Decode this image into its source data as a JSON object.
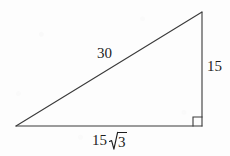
{
  "figure": {
    "kind": "right-triangle",
    "background_color": "#fdfdfd",
    "stroke_color": "#3a3a3a",
    "text_color": "#1d1d1d"
  },
  "geometry": {
    "left_vertex": {
      "x": 16,
      "y": 126
    },
    "bottom_right_vertex": {
      "x": 202,
      "y": 126
    },
    "top_vertex": {
      "x": 202,
      "y": 12
    },
    "right_angle_marker": {
      "x": 193,
      "y": 117,
      "size": 9
    }
  },
  "labels": {
    "hypotenuse": "30",
    "vertical_leg": "15",
    "base_coefficient": "15",
    "base_radicand": "3"
  }
}
